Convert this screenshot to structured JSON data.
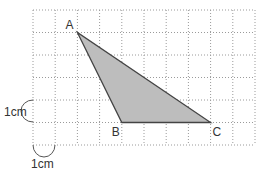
{
  "diagram": {
    "grid": {
      "x0": 33,
      "y0": 10,
      "cols": 10,
      "rows": 6,
      "cell_w": 22.2,
      "cell_h": 22.5,
      "line_color": "#9a9a9a"
    },
    "triangle": {
      "fill": "#bdbdbd",
      "stroke": "#444444",
      "vertices": [
        {
          "label": "A",
          "col": 2,
          "row": 1
        },
        {
          "label": "B",
          "col": 4,
          "row": 5
        },
        {
          "label": "C",
          "col": 8,
          "row": 5
        }
      ]
    },
    "scale_labels": {
      "vertical": "1cm",
      "horizontal": "1cm"
    }
  }
}
